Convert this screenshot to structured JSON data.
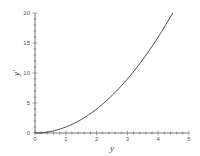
{
  "chart_data": {
    "type": "line",
    "title": "",
    "xlabel": "y",
    "ylabel": "y′",
    "xlim": [
      0,
      5
    ],
    "ylim": [
      0,
      20
    ],
    "xticks": [
      0,
      1,
      2,
      3,
      4,
      5
    ],
    "yticks": [
      0,
      5,
      10,
      15,
      20
    ],
    "grid": false,
    "legend": null,
    "series": [
      {
        "name": "y' = y^2",
        "x": [
          0,
          0.25,
          0.5,
          0.75,
          1.0,
          1.25,
          1.5,
          1.75,
          2.0,
          2.25,
          2.5,
          2.75,
          3.0,
          3.25,
          3.5,
          3.75,
          4.0,
          4.25,
          4.47
        ],
        "y": [
          0,
          0.06,
          0.25,
          0.56,
          1.0,
          1.56,
          2.25,
          3.06,
          4.0,
          5.06,
          6.25,
          7.56,
          9.0,
          10.56,
          12.25,
          14.06,
          16.0,
          18.06,
          20.0
        ],
        "color": "#333333"
      }
    ]
  },
  "colors": {
    "axis": "#555555",
    "curve": "#333333",
    "background": "#ffffff"
  }
}
